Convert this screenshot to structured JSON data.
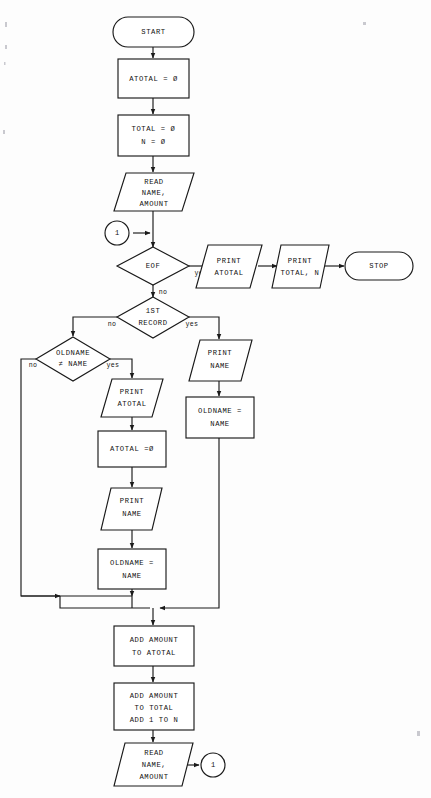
{
  "diagram": {
    "type": "flowchart",
    "background_color": "#fdfdfd",
    "line_color": "#1a1a1a",
    "shape_fill": "#ffffff"
  },
  "nodes": {
    "start": {
      "label": "START",
      "shape": "terminator"
    },
    "init_atotal": {
      "label": "ATOTAL = Ø",
      "shape": "process"
    },
    "init_total_n": {
      "line1": "TOTAL = Ø",
      "line2": "N = Ø",
      "shape": "process"
    },
    "read_first": {
      "line1": "READ",
      "line2": "NAME,",
      "line3": "AMOUNT",
      "shape": "input-output"
    },
    "connector_in": {
      "label": "1",
      "shape": "connector"
    },
    "eof": {
      "label": "EOF",
      "shape": "decision"
    },
    "print_atotal_end": {
      "line1": "PRINT",
      "line2": "ATOTAL",
      "shape": "input-output"
    },
    "print_total_n": {
      "line1": "PRINT",
      "line2": "TOTAL, N",
      "shape": "input-output"
    },
    "stop": {
      "label": "STOP",
      "shape": "terminator"
    },
    "first_record": {
      "line1": "1ST",
      "line2": "RECORD",
      "shape": "decision"
    },
    "oldname_ne_name": {
      "line1": "OLDNAME",
      "line2": "≠ NAME",
      "shape": "decision"
    },
    "print_atotal_break": {
      "line1": "PRINT",
      "line2": "ATOTAL",
      "shape": "input-output"
    },
    "reset_atotal": {
      "label": "ATOTAL =Ø",
      "shape": "process"
    },
    "print_name_break": {
      "line1": "PRINT",
      "line2": "NAME",
      "shape": "input-output"
    },
    "set_oldname_break": {
      "line1": "OLDNAME =",
      "line2": "NAME",
      "shape": "process"
    },
    "print_name_first": {
      "line1": "PRINT",
      "line2": "NAME",
      "shape": "input-output"
    },
    "set_oldname_first": {
      "line1": "OLDNAME =",
      "line2": "NAME",
      "shape": "process"
    },
    "add_amount_atotal": {
      "line1": "ADD AMOUNT",
      "line2": "TO ATOTAL",
      "shape": "process"
    },
    "add_amount_total": {
      "line1": "ADD AMOUNT",
      "line2": "TO TOTAL",
      "line3": "ADD 1 TO N",
      "shape": "process"
    },
    "read_next": {
      "line1": "READ",
      "line2": "NAME,",
      "line3": "AMOUNT",
      "shape": "input-output"
    },
    "connector_out": {
      "label": "1",
      "shape": "connector"
    }
  },
  "edge_labels": {
    "eof_yes": "yes",
    "eof_no": "no",
    "first_record_no": "no",
    "first_record_yes": "yes",
    "oldname_no": "no",
    "oldname_yes": "yes"
  }
}
